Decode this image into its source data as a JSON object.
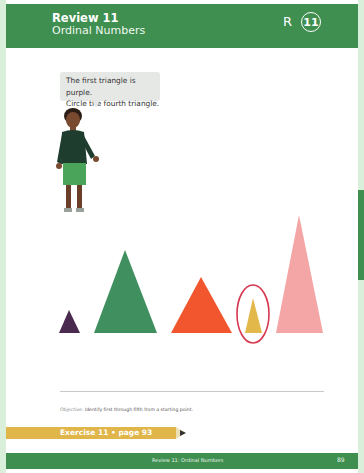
{
  "header": {
    "title": "Review 11",
    "subtitle": "Ordinal Numbers",
    "section_letter": "R",
    "badge_number": "11",
    "color": "#3f8f50"
  },
  "speech_bubble": {
    "line1": "The first triangle is purple.",
    "line2": "Circle the fourth triangle."
  },
  "triangles": [
    {
      "position": 1,
      "color": "#4a2a4e",
      "circled": false
    },
    {
      "position": 2,
      "color": "#3f8f5f",
      "circled": false
    },
    {
      "position": 3,
      "color": "#f2562e",
      "circled": false
    },
    {
      "position": 4,
      "color": "#e3b84a",
      "circled": true,
      "circle_color": "#d6384f"
    },
    {
      "position": 5,
      "color": "#f4a5a5",
      "circled": false
    }
  ],
  "objective": {
    "label": "Objective:",
    "text": "Identify first through fifth from a starting point."
  },
  "exercise": {
    "label": "Exercise 11 • page 93",
    "color": "#e0b64a"
  },
  "footer": {
    "label": "Review 11: Ordinal Numbers",
    "page_number": "89"
  }
}
